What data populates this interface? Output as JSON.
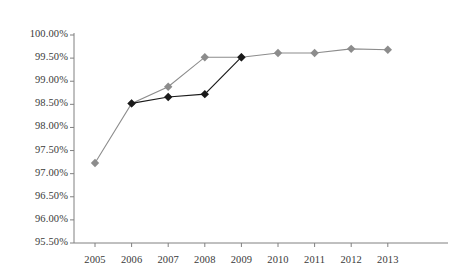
{
  "chart_data": {
    "type": "line",
    "title": "",
    "xlabel": "",
    "ylabel": "",
    "categories": [
      "2005",
      "2006",
      "2007",
      "2008",
      "2009",
      "2010",
      "2011",
      "2012",
      "2013"
    ],
    "ylim": [
      95.5,
      100.0
    ],
    "ytick_step": 0.5,
    "ytick_labels": [
      "100.00%",
      "99.50%",
      "99.00%",
      "98.50%",
      "98.00%",
      "97.50%",
      "97.00%",
      "96.50%",
      "96.00%",
      "95.50%"
    ],
    "ytick_values": [
      100.0,
      99.5,
      99.0,
      98.5,
      98.0,
      97.5,
      97.0,
      96.5,
      96.0,
      95.5
    ],
    "grid": false,
    "legend": "none",
    "series": [
      {
        "name": "series-gray",
        "color": "#8c8c8c",
        "marker": "diamond",
        "x": [
          "2005",
          "2006",
          "2007",
          "2008",
          "2009",
          "2010",
          "2011",
          "2012",
          "2013"
        ],
        "values": [
          97.23,
          98.52,
          98.88,
          99.52,
          99.52,
          99.61,
          99.61,
          99.7,
          99.68
        ]
      },
      {
        "name": "series-black",
        "color": "#1a1a1a",
        "marker": "diamond",
        "x": [
          "2006",
          "2007",
          "2008",
          "2009"
        ],
        "values": [
          98.52,
          98.66,
          98.72,
          99.52
        ]
      }
    ]
  },
  "axis": {
    "line_color": "#808080",
    "tick_color": "#808080"
  }
}
